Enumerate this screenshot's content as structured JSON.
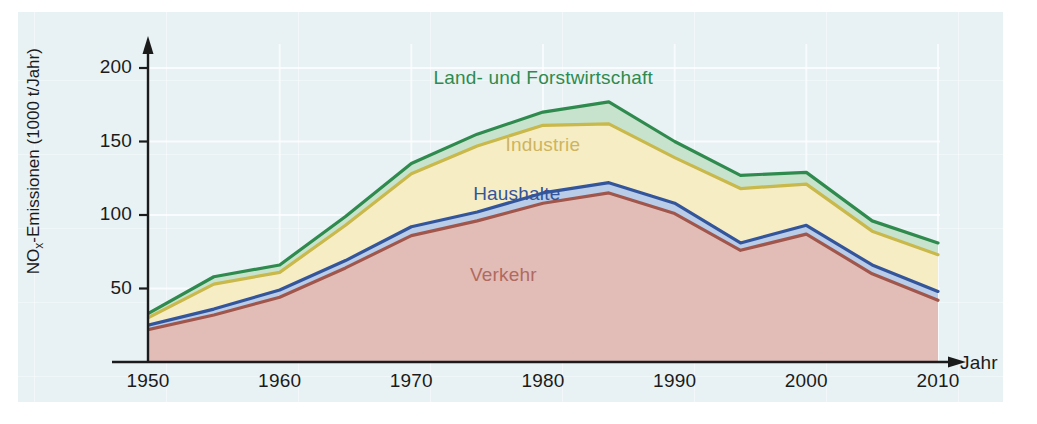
{
  "figure": {
    "background_color": "#e8f2f4",
    "page_background": "#ffffff"
  },
  "chart_data": {
    "type": "area",
    "stacked": true,
    "title": "",
    "subtitle": "",
    "xlabel": "Jahr",
    "ylabel": "NOx-Emissionen (1000 t/Jahr)",
    "ylabel_parts": {
      "prefix": "NO",
      "subscript": "x",
      "suffix": "-Emissionen (1000 t/Jahr)"
    },
    "xlim": [
      1950,
      2010
    ],
    "ylim": [
      0,
      210
    ],
    "yticks": [
      50,
      100,
      150,
      200
    ],
    "ytick_labels": [
      "50",
      "100",
      "150",
      "200"
    ],
    "xticks": [
      1950,
      1960,
      1970,
      1980,
      1990,
      2000,
      2010
    ],
    "xtick_labels": [
      "1950",
      "1960",
      "1970",
      "1980",
      "1990",
      "2000",
      "2010"
    ],
    "grid": true,
    "legend_position": "in-chart-labels",
    "x": [
      1950,
      1955,
      1960,
      1965,
      1970,
      1975,
      1980,
      1985,
      1990,
      1995,
      2000,
      2005,
      2010
    ],
    "series": [
      {
        "name": "Verkehr",
        "label": "Verkehr",
        "line_color": "#a0564a",
        "fill_color": "#e2bdb8",
        "values": [
          22,
          32,
          44,
          64,
          86,
          96,
          108,
          115,
          101,
          76,
          87,
          60,
          42
        ]
      },
      {
        "name": "Haushalte",
        "label": "Haushalte",
        "line_color": "#33559b",
        "fill_color": "#b9cce8",
        "values": [
          3,
          4,
          5,
          5,
          6,
          6,
          7,
          7,
          7,
          5,
          6,
          6,
          6
        ]
      },
      {
        "name": "Industrie",
        "label": "Industrie",
        "line_color": "#c9b84a",
        "fill_color": "#f7edc4",
        "values": [
          5,
          17,
          12,
          24,
          36,
          45,
          46,
          40,
          31,
          37,
          28,
          23,
          25
        ]
      },
      {
        "name": "Land- und Forstwirtschaft",
        "label": "Land- und Forstwirtschaft",
        "line_color": "#2f8a4e",
        "fill_color": "#c8e3cd",
        "values": [
          3,
          5,
          5,
          6,
          7,
          8,
          9,
          15,
          11,
          9,
          8,
          7,
          8
        ]
      }
    ],
    "stack_totals": [
      33,
      58,
      66,
      99,
      135,
      155,
      170,
      177,
      150,
      127,
      129,
      96,
      81
    ],
    "annotations": [
      {
        "text": "Land- und Forstwirtschaft",
        "color": "#2f8a4e",
        "x": 1980,
        "y": 192
      },
      {
        "text": "Industrie",
        "color": "#cdb45e",
        "x": 1980,
        "y": 146
      },
      {
        "text": "Haushalte",
        "color": "#33559b",
        "x": 1978,
        "y": 113
      },
      {
        "text": "Verkehr",
        "color": "#b06a5e",
        "x": 1977,
        "y": 58
      }
    ]
  }
}
